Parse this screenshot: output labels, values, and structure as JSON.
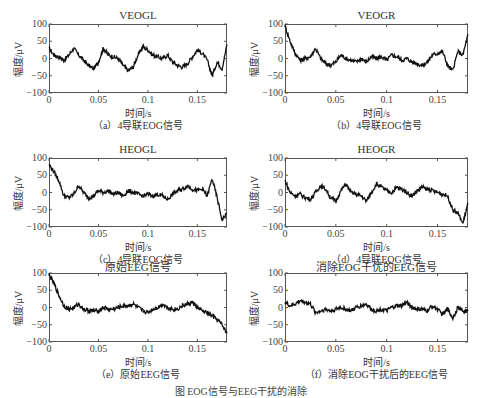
{
  "figure_caption": "图 EOG信号与EEG干扰的消除",
  "axes_common": {
    "ylabel": "幅度/μV",
    "xlabel": "时间/s",
    "yticks": [
      "100",
      "50",
      "0",
      "−50",
      "−100"
    ],
    "xticks": [
      "0",
      "0.05",
      "0.1",
      "0.15"
    ]
  },
  "panels": [
    {
      "title": "VEOGL",
      "caption": "（a）4导联EOG信号"
    },
    {
      "title": "VEOGR",
      "caption": "（b）4导联EOG信号"
    },
    {
      "title": "HEOGL",
      "caption": "（c）4导联EOG信号"
    },
    {
      "title": "HEOGR",
      "caption": "（d）4导联EOG信号"
    },
    {
      "title": "原始EEG信号",
      "caption": "（e）原始EEG信号"
    },
    {
      "title": "消除EOG干优的EEG信号",
      "caption": "（f）消除EOG干扰后的EEG信号"
    }
  ],
  "chart_data": [
    {
      "type": "line",
      "title": "VEOGL",
      "xlabel": "时间/s",
      "ylabel": "幅度/μV",
      "xlim": [
        0,
        0.18
      ],
      "ylim": [
        -100,
        100
      ],
      "x": [
        0,
        0.005,
        0.01,
        0.015,
        0.02,
        0.025,
        0.03,
        0.035,
        0.04,
        0.045,
        0.05,
        0.055,
        0.06,
        0.065,
        0.07,
        0.075,
        0.08,
        0.085,
        0.09,
        0.095,
        0.1,
        0.105,
        0.11,
        0.115,
        0.12,
        0.125,
        0.13,
        0.135,
        0.14,
        0.145,
        0.15,
        0.155,
        0.16,
        0.165,
        0.17,
        0.175,
        0.18
      ],
      "values": [
        30,
        10,
        5,
        -5,
        10,
        30,
        10,
        -5,
        -20,
        -30,
        -10,
        30,
        10,
        5,
        0,
        -20,
        -35,
        -25,
        10,
        35,
        25,
        10,
        5,
        0,
        10,
        -10,
        -20,
        -25,
        -15,
        5,
        25,
        15,
        -5,
        -50,
        -10,
        -30,
        40
      ]
    },
    {
      "type": "line",
      "title": "VEOGR",
      "xlabel": "时间/s",
      "ylabel": "幅度/μV",
      "xlim": [
        0,
        0.18
      ],
      "ylim": [
        -100,
        100
      ],
      "x": [
        0,
        0.005,
        0.01,
        0.015,
        0.02,
        0.025,
        0.03,
        0.035,
        0.04,
        0.045,
        0.05,
        0.055,
        0.06,
        0.065,
        0.07,
        0.075,
        0.08,
        0.085,
        0.09,
        0.095,
        0.1,
        0.105,
        0.11,
        0.115,
        0.12,
        0.125,
        0.13,
        0.135,
        0.14,
        0.145,
        0.15,
        0.155,
        0.16,
        0.165,
        0.17,
        0.175,
        0.18
      ],
      "values": [
        95,
        50,
        15,
        -5,
        0,
        5,
        30,
        0,
        -15,
        -20,
        -10,
        10,
        0,
        -5,
        -10,
        0,
        -10,
        5,
        0,
        5,
        -5,
        10,
        5,
        -5,
        0,
        -10,
        -15,
        -20,
        -10,
        10,
        15,
        20,
        -20,
        -35,
        20,
        10,
        70
      ]
    },
    {
      "type": "line",
      "title": "HEOGL",
      "xlabel": "时间/s",
      "ylabel": "幅度/μV",
      "xlim": [
        0,
        0.18
      ],
      "ylim": [
        -100,
        100
      ],
      "x": [
        0,
        0.005,
        0.01,
        0.015,
        0.02,
        0.025,
        0.03,
        0.035,
        0.04,
        0.045,
        0.05,
        0.055,
        0.06,
        0.065,
        0.07,
        0.075,
        0.08,
        0.085,
        0.09,
        0.095,
        0.1,
        0.105,
        0.11,
        0.115,
        0.12,
        0.125,
        0.13,
        0.135,
        0.14,
        0.145,
        0.15,
        0.155,
        0.16,
        0.165,
        0.17,
        0.175,
        0.18
      ],
      "values": [
        80,
        60,
        35,
        -10,
        -15,
        -5,
        20,
        0,
        -15,
        -10,
        5,
        0,
        5,
        -5,
        0,
        -10,
        5,
        0,
        -5,
        -10,
        -5,
        -10,
        -5,
        -10,
        -20,
        -5,
        5,
        10,
        20,
        10,
        5,
        10,
        -10,
        40,
        -15,
        -80,
        -60
      ]
    },
    {
      "type": "line",
      "title": "HEOGR",
      "xlabel": "时间/s",
      "ylabel": "幅度/μV",
      "xlim": [
        0,
        0.18
      ],
      "ylim": [
        -100,
        100
      ],
      "x": [
        0,
        0.005,
        0.01,
        0.015,
        0.02,
        0.025,
        0.03,
        0.035,
        0.04,
        0.045,
        0.05,
        0.055,
        0.06,
        0.065,
        0.07,
        0.075,
        0.08,
        0.085,
        0.09,
        0.095,
        0.1,
        0.105,
        0.11,
        0.115,
        0.12,
        0.125,
        0.13,
        0.135,
        0.14,
        0.145,
        0.15,
        0.155,
        0.16,
        0.165,
        0.17,
        0.175,
        0.18
      ],
      "values": [
        35,
        0,
        -10,
        -5,
        -15,
        -20,
        0,
        20,
        10,
        -15,
        -25,
        5,
        25,
        0,
        -5,
        -10,
        -25,
        0,
        25,
        15,
        5,
        0,
        15,
        10,
        0,
        -10,
        5,
        15,
        10,
        5,
        0,
        -5,
        -10,
        -50,
        -60,
        -90,
        -30
      ]
    },
    {
      "type": "line",
      "title": "原始EEG信号",
      "xlabel": "时间/s",
      "ylabel": "幅度/μV",
      "xlim": [
        0,
        0.18
      ],
      "ylim": [
        -100,
        100
      ],
      "x": [
        0,
        0.005,
        0.01,
        0.015,
        0.02,
        0.025,
        0.03,
        0.035,
        0.04,
        0.045,
        0.05,
        0.055,
        0.06,
        0.065,
        0.07,
        0.075,
        0.08,
        0.085,
        0.09,
        0.095,
        0.1,
        0.105,
        0.11,
        0.115,
        0.12,
        0.125,
        0.13,
        0.135,
        0.14,
        0.145,
        0.15,
        0.155,
        0.16,
        0.165,
        0.17,
        0.175,
        0.18
      ],
      "values": [
        95,
        70,
        35,
        5,
        -5,
        0,
        10,
        -5,
        -10,
        -10,
        -10,
        0,
        -5,
        -5,
        0,
        5,
        5,
        10,
        0,
        -10,
        -15,
        -5,
        0,
        10,
        0,
        -5,
        -5,
        5,
        10,
        15,
        0,
        -10,
        -15,
        -25,
        -35,
        -50,
        -75
      ]
    },
    {
      "type": "line",
      "title": "消除EOG干优的EEG信号",
      "xlabel": "时间/s",
      "ylabel": "幅度/μV",
      "xlim": [
        0,
        0.18
      ],
      "ylim": [
        -100,
        100
      ],
      "x": [
        0,
        0.005,
        0.01,
        0.015,
        0.02,
        0.025,
        0.03,
        0.035,
        0.04,
        0.045,
        0.05,
        0.055,
        0.06,
        0.065,
        0.07,
        0.075,
        0.08,
        0.085,
        0.09,
        0.095,
        0.1,
        0.105,
        0.11,
        0.115,
        0.12,
        0.125,
        0.13,
        0.135,
        0.14,
        0.145,
        0.15,
        0.155,
        0.16,
        0.165,
        0.17,
        0.175,
        0.18
      ],
      "values": [
        15,
        5,
        10,
        20,
        15,
        10,
        -15,
        -10,
        -5,
        -10,
        -5,
        0,
        -5,
        -10,
        0,
        5,
        10,
        -5,
        -10,
        -5,
        -10,
        0,
        5,
        5,
        15,
        0,
        -5,
        -5,
        -10,
        5,
        -5,
        -20,
        -5,
        -30,
        0,
        -10,
        -10
      ]
    }
  ]
}
